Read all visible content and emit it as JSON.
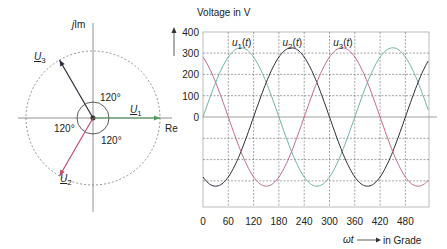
{
  "phasor_diagram": {
    "imag_axis_label": "j Im",
    "real_axis_label": "Re",
    "angle_labels": [
      "120°",
      "120°",
      "120°"
    ],
    "phasors": [
      {
        "name": "U1",
        "label_main": "U",
        "label_sub": "1",
        "angle_deg": 0,
        "color": "#4f9a5a"
      },
      {
        "name": "U2",
        "label_main": "U",
        "label_sub": "2",
        "angle_deg": -120,
        "color": "#c0506a"
      },
      {
        "name": "U3",
        "label_main": "U",
        "label_sub": "3",
        "angle_deg": 120,
        "color": "#2b2b3a"
      }
    ]
  },
  "chart_data": {
    "type": "line",
    "title": "",
    "ylabel": "Voltage in V",
    "xlabel": "ωt → in Grade",
    "xlabel_prefix": "ωt",
    "xlabel_suffix": "in Grade",
    "x_ticks": [
      0,
      60,
      120,
      180,
      240,
      300,
      360,
      420,
      480
    ],
    "y_ticks": [
      400,
      300,
      200,
      100,
      0
    ],
    "xlim": [
      0,
      540
    ],
    "ylim": [
      -420,
      400
    ],
    "grid": true,
    "amplitude": 325,
    "series": [
      {
        "name": "u1(t)",
        "label_main": "u",
        "label_sub": "1",
        "phase_deg": 0,
        "color": "#6fb3a0",
        "label_x": 90
      },
      {
        "name": "u2(t)",
        "label_main": "u",
        "label_sub": "2",
        "phase_deg": -120,
        "color": "#2b2b3a",
        "label_x": 210
      },
      {
        "name": "u3(t)",
        "label_main": "u",
        "label_sub": "3",
        "phase_deg": -240,
        "color": "#c06a88",
        "label_x": 330
      }
    ]
  }
}
